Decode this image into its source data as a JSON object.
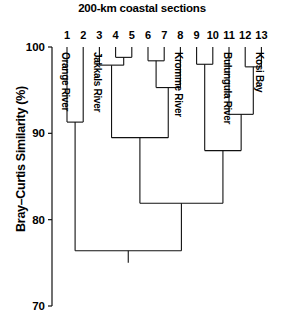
{
  "chart_data": {
    "type": "dendrogram",
    "title": "200-km coastal sections",
    "xlabel": "",
    "ylabel": "Bray–Curtis Similarity (%)",
    "ylim": [
      70,
      100
    ],
    "yticks": [
      100,
      90,
      80,
      70
    ],
    "ytick_labels": [
      "100",
      "90",
      "80",
      "70"
    ],
    "y_axis_inverted": true,
    "grid": false,
    "legend": "none",
    "leaves": [
      {
        "id": 1,
        "label": "1",
        "name": "Orange River"
      },
      {
        "id": 2,
        "label": "2",
        "name": ""
      },
      {
        "id": 3,
        "label": "3",
        "name": "Jakkals River"
      },
      {
        "id": 4,
        "label": "4",
        "name": ""
      },
      {
        "id": 5,
        "label": "5",
        "name": ""
      },
      {
        "id": 6,
        "label": "6",
        "name": ""
      },
      {
        "id": 7,
        "label": "7",
        "name": ""
      },
      {
        "id": 8,
        "label": "8",
        "name": "Kromme River"
      },
      {
        "id": 9,
        "label": "9",
        "name": ""
      },
      {
        "id": 10,
        "label": "10",
        "name": ""
      },
      {
        "id": 11,
        "label": "11",
        "name": "Bulungula River"
      },
      {
        "id": 12,
        "label": "12",
        "name": ""
      },
      {
        "id": 13,
        "label": "13",
        "name": "Kosi Bay"
      }
    ],
    "leaf_names_visible": [
      "Orange River",
      "Jakkals River",
      "Kromme River",
      "Bulungula River",
      "Kosi Bay"
    ],
    "merges": [
      {
        "id": "m1",
        "children": [
          "4",
          "5"
        ],
        "similarity": 98.8
      },
      {
        "id": "m2",
        "children": [
          "3",
          "m1"
        ],
        "similarity": 97.9
      },
      {
        "id": "m3",
        "children": [
          "6",
          "7"
        ],
        "similarity": 98.4
      },
      {
        "id": "m4",
        "children": [
          "m3",
          "8"
        ],
        "similarity": 95.3
      },
      {
        "id": "m5",
        "children": [
          "9",
          "10"
        ],
        "similarity": 98.0
      },
      {
        "id": "m6",
        "children": [
          "12",
          "13"
        ],
        "similarity": 97.7
      },
      {
        "id": "m7",
        "children": [
          "11",
          "m6"
        ],
        "similarity": 92.2
      },
      {
        "id": "m8",
        "children": [
          "1",
          "2"
        ],
        "similarity": 91.3
      },
      {
        "id": "m9",
        "children": [
          "m2",
          "m4"
        ],
        "similarity": 89.5
      },
      {
        "id": "m10",
        "children": [
          "m5",
          "m7"
        ],
        "similarity": 88.0
      },
      {
        "id": "m11",
        "children": [
          "m9",
          "m10"
        ],
        "similarity": 81.9
      },
      {
        "id": "m12",
        "children": [
          "m8",
          "m11"
        ],
        "similarity": 76.4
      }
    ],
    "line_color": "#111111",
    "background_color": "#ffffff"
  }
}
